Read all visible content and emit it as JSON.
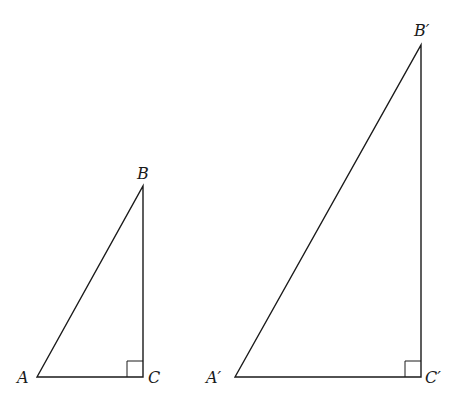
{
  "figure": {
    "triangles": [
      {
        "name": "ABC",
        "vertices": {
          "A": {
            "label": "A",
            "x": 37,
            "y": 377
          },
          "B": {
            "label": "B",
            "x": 143,
            "y": 186
          },
          "C": {
            "label": "C",
            "x": 143,
            "y": 377
          }
        },
        "right_angle_at": "C"
      },
      {
        "name": "A'B'C'",
        "vertices": {
          "A": {
            "label": "A′",
            "x": 235,
            "y": 377
          },
          "B": {
            "label": "B′",
            "x": 421,
            "y": 45
          },
          "C": {
            "label": "C′",
            "x": 421,
            "y": 377
          }
        },
        "right_angle_at": "C′"
      }
    ]
  },
  "labels": {
    "small_A": "A",
    "small_B": "B",
    "small_C": "C",
    "large_A": "A′",
    "large_B": "B′",
    "large_C": "C′"
  }
}
